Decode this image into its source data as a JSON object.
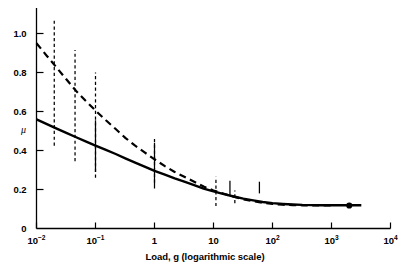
{
  "chart_data": {
    "type": "line",
    "title": "",
    "xlabel": "Load, g (logarithmic scale)",
    "ylabel": "μ",
    "xscale": "log",
    "xlim": [
      0.01,
      10000
    ],
    "ylim": [
      0,
      1.08
    ],
    "grid": false,
    "legend": null,
    "xticks": [
      {
        "value": 0.01,
        "label_mantissa": "10",
        "label_exponent": "−2"
      },
      {
        "value": 0.1,
        "label_mantissa": "10",
        "label_exponent": "−1"
      },
      {
        "value": 1,
        "label_mantissa": "1",
        "label_exponent": ""
      },
      {
        "value": 10,
        "label_mantissa": "10",
        "label_exponent": ""
      },
      {
        "value": 100,
        "label_mantissa": "10",
        "label_exponent": "2"
      },
      {
        "value": 1000,
        "label_mantissa": "10",
        "label_exponent": "3"
      },
      {
        "value": 10000,
        "label_mantissa": "10",
        "label_exponent": "4"
      }
    ],
    "yticks": [
      {
        "value": 0,
        "label": "0"
      },
      {
        "value": 0.2,
        "label": "0.2"
      },
      {
        "value": 0.4,
        "label": "0.4"
      },
      {
        "value": 0.6,
        "label": "0.6"
      },
      {
        "value": 0.8,
        "label": "0.8"
      },
      {
        "value": 1.0,
        "label": "1.0"
      }
    ],
    "series": [
      {
        "name": "upper-dashed-curve",
        "style": "dashed",
        "color": "#000000",
        "x": [
          0.01,
          0.015,
          0.022,
          0.032,
          0.047,
          0.068,
          0.1,
          0.15,
          0.22,
          0.32,
          0.47,
          0.68,
          1.0,
          1.5,
          2.2,
          3.2,
          4.7,
          6.8,
          10,
          15,
          22,
          32,
          47,
          68,
          100,
          150,
          220,
          320,
          470,
          680,
          1000
        ],
        "y": [
          0.95,
          0.885,
          0.825,
          0.765,
          0.705,
          0.655,
          0.605,
          0.555,
          0.51,
          0.465,
          0.425,
          0.39,
          0.355,
          0.32,
          0.29,
          0.265,
          0.24,
          0.215,
          0.195,
          0.178,
          0.163,
          0.15,
          0.14,
          0.132,
          0.126,
          0.122,
          0.12,
          0.119,
          0.118,
          0.118,
          0.118
        ]
      },
      {
        "name": "lower-solid-curve",
        "style": "solid",
        "color": "#000000",
        "x": [
          0.01,
          0.015,
          0.022,
          0.032,
          0.047,
          0.068,
          0.1,
          0.15,
          0.22,
          0.32,
          0.47,
          0.68,
          1.0,
          1.5,
          2.2,
          3.2,
          4.7,
          6.8,
          10,
          15,
          22,
          32,
          47,
          68,
          100,
          150,
          220,
          320,
          470,
          680,
          1000,
          1500,
          2200,
          3200
        ],
        "y": [
          0.56,
          0.535,
          0.512,
          0.49,
          0.468,
          0.447,
          0.425,
          0.403,
          0.382,
          0.36,
          0.338,
          0.317,
          0.296,
          0.276,
          0.257,
          0.24,
          0.222,
          0.205,
          0.19,
          0.176,
          0.164,
          0.153,
          0.144,
          0.136,
          0.13,
          0.126,
          0.123,
          0.121,
          0.12,
          0.119,
          0.119,
          0.119,
          0.119,
          0.119
        ]
      }
    ],
    "error_bars": [
      {
        "x": 0.02,
        "y_low": 0.425,
        "y_high": 1.08,
        "style": "dashed"
      },
      {
        "x": 0.045,
        "y_low": 0.345,
        "y_high": 0.915,
        "style": "dashed"
      },
      {
        "x": 0.1,
        "y_low": 0.26,
        "y_high": 0.8,
        "style": "dashed"
      },
      {
        "x": 0.1,
        "y_low": 0.29,
        "y_high": 0.555,
        "style": "solid"
      },
      {
        "x": 1.0,
        "y_low": 0.235,
        "y_high": 0.47,
        "style": "dashed"
      },
      {
        "x": 1.0,
        "y_low": 0.205,
        "y_high": 0.44,
        "style": "solid"
      },
      {
        "x": 11.0,
        "y_low": 0.115,
        "y_high": 0.265,
        "style": "dashed"
      },
      {
        "x": 19.0,
        "y_low": 0.165,
        "y_high": 0.245,
        "style": "solid"
      },
      {
        "x": 23.0,
        "y_low": 0.13,
        "y_high": 0.195,
        "style": "dashed"
      },
      {
        "x": 60.0,
        "y_low": 0.18,
        "y_high": 0.24,
        "style": "solid"
      }
    ],
    "points": [
      {
        "x": 2000,
        "y": 0.118,
        "marker": "filled-circle",
        "size": 5
      }
    ]
  }
}
